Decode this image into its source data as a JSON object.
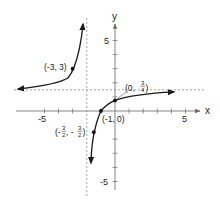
{
  "figure": {
    "function": "f(x) = 3(x+1) / (2(x+2))",
    "axes": {
      "x_label": "x",
      "y_label": "y",
      "x_ticks": [
        -5,
        5
      ],
      "y_ticks": [
        5,
        -5
      ],
      "x_tick_labels": [
        "-5",
        "5"
      ],
      "y_tick_labels": [
        "5",
        "-5"
      ]
    },
    "asymptotes": {
      "vertical": "x = -2",
      "horizontal": "y = 3/2"
    },
    "points": [
      {
        "label": "(-3, 3)",
        "x": -3,
        "y": 3
      },
      {
        "label_prefix": "(0, ",
        "frac_num": "3",
        "frac_den": "4",
        "label_suffix": ")",
        "x": 0,
        "y": 0.75
      },
      {
        "label": "(-1, 0)",
        "x": -1,
        "y": 0
      },
      {
        "label_prefix": "(-",
        "frac_num": "3",
        "frac_den": "2",
        "label_mid": ", -",
        "frac2_num": "3",
        "frac2_den": "2",
        "label_suffix": ")",
        "x": -1.5,
        "y": -1.5
      }
    ],
    "colors": {
      "curve": "#1a1a1a",
      "axis": "#888888",
      "asymptote": "#999999",
      "point": "#111111"
    }
  }
}
